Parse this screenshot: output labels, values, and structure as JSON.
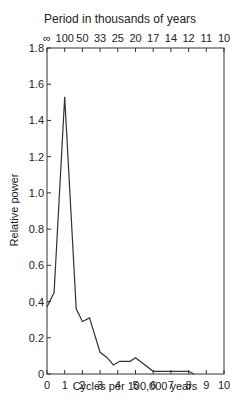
{
  "chart_data": {
    "type": "line",
    "title": "Period in thousands of years",
    "xlabel": "Cycles per 100,000 years",
    "ylabel": "Relative power",
    "xlim": [
      0,
      10
    ],
    "ylim": [
      0,
      1.8
    ],
    "grid": false,
    "legend": null,
    "x_ticks": [
      "0",
      "1",
      "2",
      "3",
      "4",
      "5",
      "6",
      "7",
      "8",
      "9",
      "10"
    ],
    "y_ticks": [
      "0",
      "0.2",
      "0.4",
      "0.6",
      "0.8",
      "1.0",
      "1.2",
      "1.4",
      "1.6",
      "1.8"
    ],
    "top_axis_label": "Period in thousands of years",
    "top_ticks": [
      "∞",
      "100",
      "50",
      "33",
      "25",
      "20",
      "17",
      "14",
      "12",
      "11",
      "10"
    ],
    "series": [
      {
        "name": "Relative power",
        "x": [
          0,
          0.4,
          1.0,
          1.65,
          2.0,
          2.4,
          3.0,
          3.4,
          3.75,
          4.1,
          4.7,
          5.0,
          6.0,
          8.0,
          8.3
        ],
        "values": [
          0.37,
          0.45,
          1.53,
          0.36,
          0.29,
          0.31,
          0.12,
          0.09,
          0.05,
          0.07,
          0.07,
          0.09,
          0.015,
          0.015,
          0.0
        ]
      }
    ]
  },
  "labels": {
    "top_title": "Period in thousands of years",
    "xlabel": "Cycles per 100,000 years",
    "ylabel": "Relative power"
  }
}
